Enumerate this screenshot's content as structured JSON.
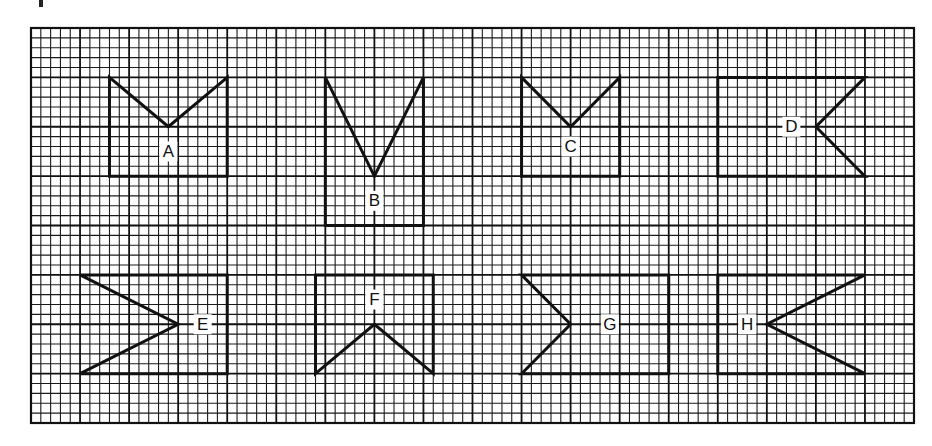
{
  "diagram": {
    "type": "grid-figures",
    "grid": {
      "columns_minor": 90,
      "rows_minor": 40,
      "minor_per_major": 5
    },
    "figures": [
      {
        "label": "A",
        "description": "rectangle with V-notch cut into top edge",
        "points": [
          [
            8,
            5
          ],
          [
            14,
            10
          ],
          [
            20,
            5
          ],
          [
            20,
            15
          ],
          [
            8,
            15
          ]
        ],
        "label_at": [
          14,
          12.5
        ]
      },
      {
        "label": "B",
        "description": "tall rectangle with deep V-notch cut into top edge",
        "points": [
          [
            30,
            5
          ],
          [
            35,
            15
          ],
          [
            40,
            5
          ],
          [
            40,
            20
          ],
          [
            30,
            20
          ]
        ],
        "label_at": [
          35,
          17.5
        ]
      },
      {
        "label": "C",
        "description": "rectangle with V-notch cut into top edge",
        "points": [
          [
            50,
            5
          ],
          [
            55,
            10
          ],
          [
            60,
            5
          ],
          [
            60,
            15
          ],
          [
            50,
            15
          ]
        ],
        "label_at": [
          55,
          12
        ]
      },
      {
        "label": "D",
        "description": "wide rectangle with V-notch cut into right edge",
        "points": [
          [
            70,
            5
          ],
          [
            85,
            5
          ],
          [
            80,
            10
          ],
          [
            85,
            15
          ],
          [
            70,
            15
          ]
        ],
        "label_at": [
          77.5,
          10
        ]
      },
      {
        "label": "E",
        "description": "rectangle with deep V-notch cut into left edge",
        "points": [
          [
            5,
            25
          ],
          [
            20,
            25
          ],
          [
            20,
            35
          ],
          [
            5,
            35
          ],
          [
            15,
            30
          ]
        ],
        "label_at": [
          17.5,
          30
        ]
      },
      {
        "label": "F",
        "description": "rectangle with inverted V-notch cut into bottom edge",
        "points": [
          [
            29,
            25
          ],
          [
            41,
            25
          ],
          [
            41,
            35
          ],
          [
            35,
            30
          ],
          [
            29,
            35
          ]
        ],
        "label_at": [
          35,
          27.5
        ]
      },
      {
        "label": "G",
        "description": "wide rectangle with V-notch cut into left edge",
        "points": [
          [
            50,
            25
          ],
          [
            65,
            25
          ],
          [
            65,
            35
          ],
          [
            50,
            35
          ],
          [
            55,
            30
          ]
        ],
        "label_at": [
          59,
          30
        ]
      },
      {
        "label": "H",
        "description": "wide rectangle with deep V-notch cut into right edge",
        "points": [
          [
            70,
            25
          ],
          [
            85,
            25
          ],
          [
            75,
            30
          ],
          [
            85,
            35
          ],
          [
            70,
            35
          ]
        ],
        "label_at": [
          73,
          30
        ]
      }
    ]
  }
}
